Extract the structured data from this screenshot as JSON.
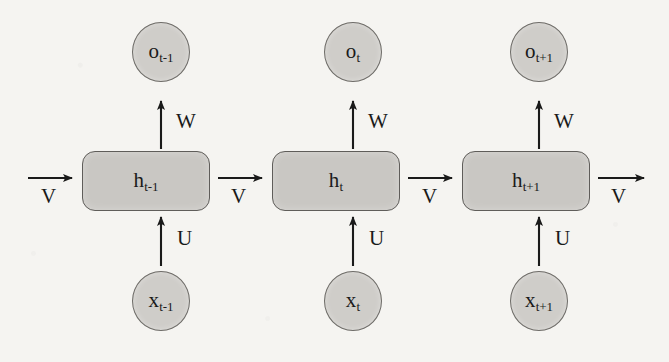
{
  "diagram": {
    "background_color": "#f5f4f1",
    "node_fill_color": "#cfcdc9",
    "box_fill_color": "#c9c7c3",
    "node_stroke_color": "#6e6c68",
    "arrow_color": "#1a1a1a"
  },
  "timesteps": [
    {
      "id": "t-minus-1",
      "output_node": {
        "base": "o",
        "sub": "t-1"
      },
      "hidden_node": {
        "base": "h",
        "sub": "t-1"
      },
      "input_node": {
        "base": "x",
        "sub": "t-1"
      },
      "output_weight_label": "W",
      "input_weight_label": "U",
      "incoming_recurrent_label": "V",
      "outgoing_recurrent_label": "V"
    },
    {
      "id": "t",
      "output_node": {
        "base": "o",
        "sub": "t"
      },
      "hidden_node": {
        "base": "h",
        "sub": "t"
      },
      "input_node": {
        "base": "x",
        "sub": "t"
      },
      "output_weight_label": "W",
      "input_weight_label": "U",
      "outgoing_recurrent_label": "V"
    },
    {
      "id": "t-plus-1",
      "output_node": {
        "base": "o",
        "sub": "t+1"
      },
      "hidden_node": {
        "base": "h",
        "sub": "t+1"
      },
      "input_node": {
        "base": "x",
        "sub": "t+1"
      },
      "output_weight_label": "W",
      "input_weight_label": "U",
      "outgoing_recurrent_label": "V"
    }
  ]
}
